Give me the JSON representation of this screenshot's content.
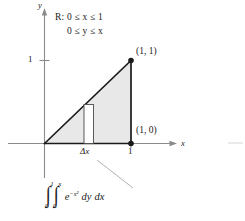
{
  "figure": {
    "axes": {
      "x_axis_label": "x",
      "y_axis_label": "y",
      "x_tick_label": "1",
      "y_tick_label": "1"
    },
    "region_description": {
      "line1": "R: 0 ≤ x ≤ 1",
      "line2": "0 ≤ y ≤ x"
    },
    "vertex_labels": {
      "top_right": "(1, 1)",
      "bottom_right": "(1, 0)"
    },
    "strip_label": "Δx",
    "integral": {
      "outer_sign": "∫",
      "outer_lower": "0",
      "outer_upper": "1",
      "inner_sign": "∫",
      "inner_lower": "0",
      "inner_upper": "x",
      "integrand_base": "e",
      "integrand_exponent": "−x²",
      "differential_inner": "dy",
      "differential_outer": "dx"
    },
    "colors": {
      "region_fill": "#e8e8e8",
      "region_outline": "#1a1a1a",
      "axis": "#8a8a8a",
      "leader_line": "#a8a8a8",
      "text": "#1a1a1a",
      "strip_fill": "#ffffff"
    }
  }
}
